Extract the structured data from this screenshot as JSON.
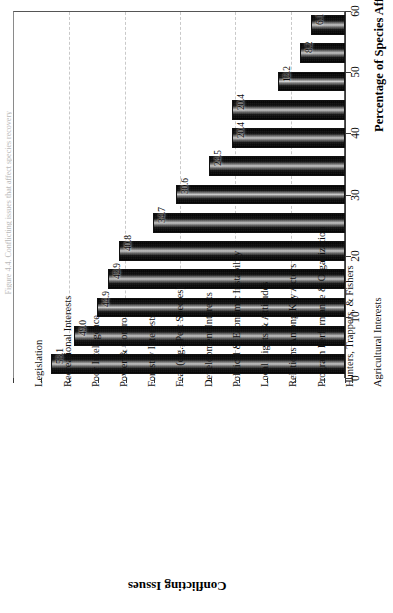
{
  "figure": {
    "caption_sliver": "Figure 4.4. Conflicting issues that affect species recovery"
  },
  "chart_data": {
    "type": "bar",
    "orientation": "vertical-rotated",
    "title": "",
    "xlabel": "Conflicting Issues",
    "ylabel": "Percentage of Species Affected",
    "ylim": [
      0,
      60
    ],
    "ytick_step": 10,
    "yticks": [
      "0",
      "10",
      "20",
      "30",
      "40",
      "50",
      "60"
    ],
    "grid": true,
    "grid_style": "dashed",
    "legend": false,
    "categories": [
      "Legislation",
      "Recreational Interests",
      "Poor Intelligence",
      "Power & Control",
      "Forestry Interests",
      "Fear (e.g., Pest Species)",
      "Development Interests",
      "Political & Economic Instability",
      "Local Rights & Attitudes",
      "Relations Among Key Actors",
      "Program Performance & Organization",
      "Hunters, Trappers, & Fishers",
      "Agricultural Interests"
    ],
    "values": [
      6.1,
      8.2,
      12.2,
      20.4,
      20.4,
      24.5,
      30.6,
      34.7,
      40.8,
      42.9,
      44.9,
      49.0,
      53.1
    ],
    "value_labels": [
      "6.1",
      "8.2",
      "12.2",
      "20.4",
      "20.4",
      "24.5",
      "30.6",
      "34.7",
      "40.8",
      "42.9",
      "44.9",
      "49.0",
      "53.1"
    ],
    "colors": {
      "bar_fill": "#111111",
      "bar_edge": "#111111",
      "grid": "#c9c9c9",
      "axis": "#3a3a3a",
      "text": "#111111",
      "background": "#ffffff"
    }
  }
}
